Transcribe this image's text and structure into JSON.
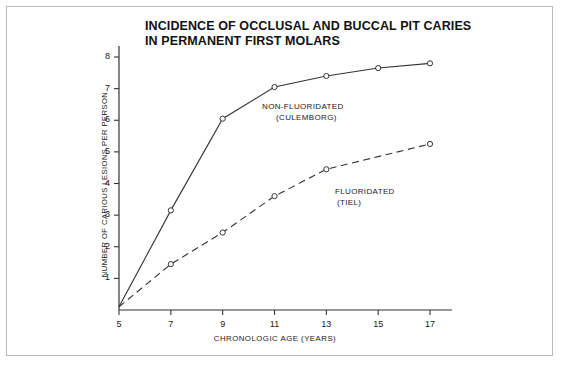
{
  "figure": {
    "title_line1": "INCIDENCE OF OCCLUSAL AND BUCCAL PIT CARIES",
    "title_line2": "IN PERMANENT FIRST MOLARS",
    "border_color": "#b9b9b9",
    "line_color": "#333333",
    "background": "#ffffff"
  },
  "annotations": {
    "nonfluoridated_line1": "NON-FLUORIDATED",
    "nonfluoridated_line2": "(CULEMBORG)",
    "fluoridated_line1": "FLUORIDATED",
    "fluoridated_line2": "(TIEL)"
  },
  "chart_data": {
    "type": "line",
    "title": "INCIDENCE OF OCCLUSAL AND BUCCAL PIT CARIES IN PERMANENT FIRST MOLARS",
    "xlabel": "CHRONOLOGIC AGE (YEARS)",
    "ylabel": "NUMBER OF CARIOUS LESIONS PER PERSON",
    "x": [
      5,
      7,
      9,
      11,
      13,
      15,
      17
    ],
    "xlim": [
      5,
      17
    ],
    "ylim": [
      0,
      8
    ],
    "xticks": [
      5,
      7,
      9,
      11,
      13,
      15,
      17
    ],
    "yticks": [
      1,
      2,
      3,
      4,
      5,
      6,
      7,
      8
    ],
    "grid": false,
    "legend_position": "inline-annotation",
    "series": [
      {
        "name": "NON-FLUORIDATED (CULEMBORG)",
        "style": "solid",
        "marker": "open-circle",
        "x": [
          5,
          7,
          9,
          11,
          13,
          15,
          17
        ],
        "values": [
          0.1,
          3.15,
          6.05,
          7.05,
          7.4,
          7.65,
          7.8
        ],
        "marker_x": [
          7,
          9,
          11,
          13,
          15,
          17
        ]
      },
      {
        "name": "FLUORIDATED (TIEL)",
        "style": "dashed",
        "marker": "open-circle",
        "x": [
          5,
          7,
          9,
          11,
          13,
          15,
          17
        ],
        "values": [
          0.1,
          1.45,
          2.45,
          3.6,
          4.45,
          4.85,
          5.25
        ],
        "marker_x": [
          7,
          9,
          11,
          13,
          17
        ]
      }
    ]
  }
}
